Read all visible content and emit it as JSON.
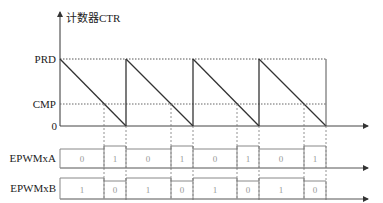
{
  "diagram": {
    "y_axis_label": "计数器CTR",
    "levels": {
      "prd": "PRD",
      "cmp": "CMP",
      "zero": "0"
    },
    "signals": [
      {
        "name": "EPWMxA",
        "bits": [
          "0",
          "1",
          "0",
          "1",
          "0",
          "1",
          "0",
          "1"
        ]
      },
      {
        "name": "EPWMxB",
        "bits": [
          "1",
          "0",
          "1",
          "0",
          "1",
          "0",
          "1",
          "0"
        ]
      }
    ],
    "periods": 4,
    "colors": {
      "line": "#333333",
      "dotted": "#555555",
      "signal": "#888888",
      "bit_text": "#999999"
    }
  }
}
